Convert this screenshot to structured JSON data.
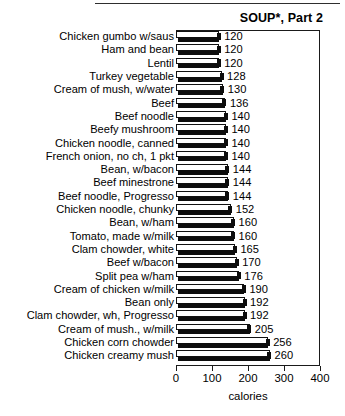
{
  "chart_data": {
    "type": "bar",
    "orientation": "horizontal",
    "title": "SOUP*, Part 2",
    "xlabel": "calories",
    "ylabel": "",
    "xlim": [
      0,
      400
    ],
    "xticks": [
      0,
      100,
      200,
      300,
      400
    ],
    "xtick_labels": [
      "0",
      "100",
      "200",
      "300",
      "400"
    ],
    "grid": false,
    "legend": null,
    "value_labels_shown": true,
    "categories": [
      "Chicken gumbo w/saus",
      "Ham and bean",
      "Lentil",
      "Turkey vegetable",
      "Cream of mush, w/water",
      "Beef",
      "Beef noodle",
      "Beefy mushroom",
      "Chicken noodle, canned",
      "French onion, no ch, 1 pkt",
      "Bean, w/bacon",
      "Beef minestrone",
      "Beef noodle, Progresso",
      "Chicken noodle, chunky",
      "Bean, w/ham",
      "Tomato, made w/milk",
      "Clam chowder, white",
      "Beef w/bacon",
      "Split pea w/ham",
      "Cream of chicken w/milk",
      "Bean only",
      "Clam chowder, wh, Progresso",
      "Cream of mush., w/milk",
      "Chicken corn chowder",
      "Chicken creamy mush"
    ],
    "values": [
      120,
      120,
      120,
      128,
      130,
      136,
      140,
      140,
      140,
      140,
      144,
      144,
      144,
      152,
      160,
      160,
      165,
      170,
      176,
      190,
      192,
      192,
      205,
      256,
      260
    ]
  },
  "page": {
    "rule_present": true
  }
}
